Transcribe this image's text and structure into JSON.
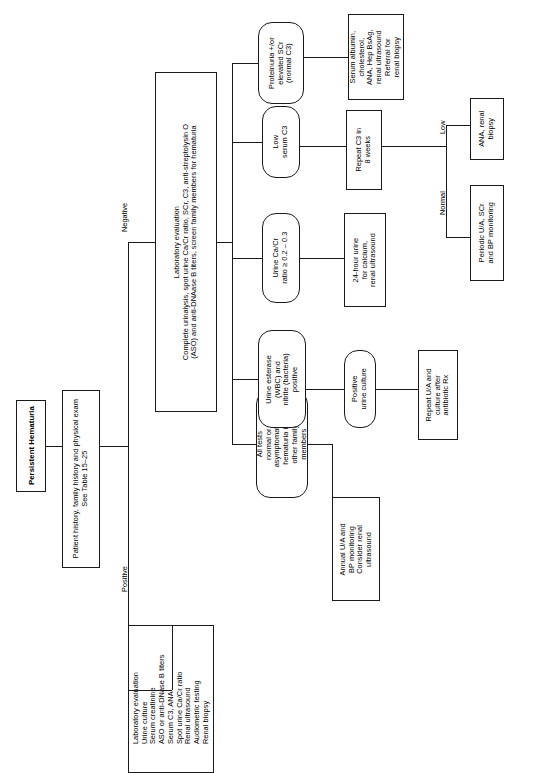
{
  "figure": {
    "orientation": "rotated-90-ccw",
    "line_color": "#1a1a1a",
    "background_color": "#ffffff"
  },
  "nodes": {
    "start": "Persistent Hematuria",
    "history": "Patient history, family history and physical exam\nSee Table 15–25",
    "lab_eval_list": "Laboratory evaluation\nUrine culture\nSerum creatinine\nASO or anti-DNase B titers\nSerum C3, ANA\nSpot urine Ca/Cr ratio\nRenal ultrasound\nAudiometric testing\nRenal biopsy",
    "lab_eval_negative": "Laboratory evaluation\nComplete urinalysis, spot urine Ca/Cr ratio, SCr, C3, anti-streptolysin O\n(ASO) and anti-DNAase B titers, screen family members for hematuria",
    "all_tests_normal": "All tests\nnormal or\nasymptomatic\nhematuria in\nother family\nmembers",
    "urine_esterase": "Urine esterase\n(WBC) and\nnitrite (bacteria)\npositive",
    "urine_cacr": "Urine Ca/Cr\nratio ≥ 0.2 – 0.3",
    "low_c3": "Low\nserum C3",
    "proteinuria": "Proteinuria +/or\nelevated SCr\n(normal C3)",
    "annual_ua": "Annual U/A and\nBP monitoring\nConsider renal\nultrasound",
    "positive_urine_culture": "Positive\nurine culture",
    "repeat_ua": "Repeat U/A and\nculture after\nantibiotic Rx",
    "urine_24h": "24-hour urine\nfor calcium,\nrenal ultrasound",
    "repeat_c3": "Repeat C3 in\n8 weeks",
    "serum_albumin": "Serum albumin,\ncholesterol,\nANA, Hep BsAg,\nrenal ultrasound\nReferral for\nrenal biopsy",
    "ana_renal_biopsy": "ANA, renal\nbiopsy",
    "periodic_ua": "Periodic U/A, SCr\nand BP monitoring"
  },
  "edge_labels": {
    "negative": "Negative",
    "positive": "Positive",
    "low": "Low",
    "normal": "Normal"
  }
}
